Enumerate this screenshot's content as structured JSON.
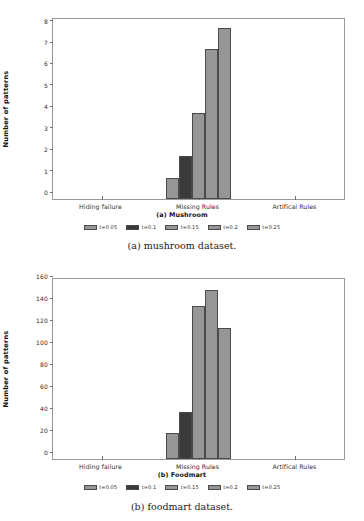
{
  "figures": [
    {
      "caption": "(a) mushroom dataset.",
      "subtitle": "(a) Mushroom",
      "chart_data": {
        "type": "bar",
        "title": "(a) Mushroom",
        "xlabel": "",
        "ylabel": "Number of patterns",
        "categories": [
          "Hiding failure",
          "Missing Rules",
          "Artifical Rules"
        ],
        "series": [
          {
            "name": "t=0.05",
            "color": "#969696",
            "values": [
              0,
              1,
              0
            ]
          },
          {
            "name": "t=0.1",
            "color": "#3a3a3a",
            "values": [
              0,
              2,
              0
            ]
          },
          {
            "name": "t=0.15",
            "color": "#969696",
            "values": [
              0,
              4,
              0
            ]
          },
          {
            "name": "t=0.2",
            "color": "#969696",
            "values": [
              0,
              7,
              0
            ]
          },
          {
            "name": "t=0.25",
            "color": "#969696",
            "values": [
              0,
              8,
              0
            ]
          }
        ],
        "yticks": [
          0,
          1,
          2,
          3,
          4,
          5,
          6,
          7,
          8
        ],
        "ylim": [
          0,
          8.4
        ],
        "grid": false,
        "legend_position": "bottom"
      }
    },
    {
      "caption": "(b) foodmart dataset.",
      "subtitle": "(b) Foodmart",
      "chart_data": {
        "type": "bar",
        "title": "(b) Foodmart",
        "xlabel": "",
        "ylabel": "Number of patterns",
        "categories": [
          "Hiding failure",
          "Missing Rules",
          "Artifical Rules"
        ],
        "series": [
          {
            "name": "t=0.05",
            "color": "#969696",
            "values": [
              0,
              24,
              0
            ]
          },
          {
            "name": "t=0.1",
            "color": "#3a3a3a",
            "values": [
              0,
              43,
              0
            ]
          },
          {
            "name": "t=0.15",
            "color": "#969696",
            "values": [
              0,
              139,
              0
            ]
          },
          {
            "name": "t=0.2",
            "color": "#969696",
            "values": [
              0,
              154,
              0
            ]
          },
          {
            "name": "t=0.25",
            "color": "#969696",
            "values": [
              0,
              119,
              0
            ]
          }
        ],
        "yticks": [
          0,
          20,
          40,
          60,
          80,
          100,
          120,
          140,
          160
        ],
        "ylim": [
          0,
          164
        ],
        "grid": false,
        "legend_position": "bottom"
      }
    }
  ]
}
